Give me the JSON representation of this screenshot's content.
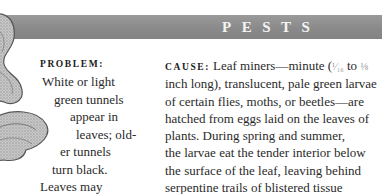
{
  "header": {
    "title": "PESTS",
    "bar_color": "#8a8a8a",
    "title_color": "#f4f4f4"
  },
  "illustration": {
    "icon": "leaf-illustration",
    "description": "grayscale sketch of leaf with miner tunnels"
  },
  "problem": {
    "label": "PROBLEM:",
    "lines": [
      "White or light",
      "green tunnels",
      "appear in",
      "leaves; old-",
      "er tunnels",
      "turn black.",
      "Leaves may"
    ]
  },
  "cause": {
    "label": "CAUSE:",
    "first_line_text": "Leaf miners—minute (",
    "fraction_1": "¹⁄₁₆",
    "fraction_between": " to ",
    "fraction_2": "⅛",
    "lines": [
      "inch long), translucent, pale green larvae",
      "of certain flies, moths, or beetles—are",
      "hatched from eggs laid on the leaves of",
      "plants. During spring and summer,",
      "the larvae eat the tender interior below",
      "the surface of the leaf, leaving behind",
      "serpentine trails of blistered tissue"
    ]
  }
}
